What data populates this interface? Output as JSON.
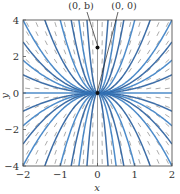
{
  "figure": {
    "title": "",
    "equation_hint": "dy/dx = 2y/x",
    "xlabel": "x",
    "ylabel": "y",
    "xlim": [
      -2,
      2
    ],
    "ylim": [
      -4,
      4
    ],
    "xticks": [
      {
        "v": -2,
        "label": "−2"
      },
      {
        "v": -1,
        "label": "−1"
      },
      {
        "v": 0,
        "label": "0"
      },
      {
        "v": 1,
        "label": "1"
      },
      {
        "v": 2,
        "label": "2"
      }
    ],
    "yticks": [
      {
        "v": -4,
        "label": "−4"
      },
      {
        "v": -2,
        "label": "−2"
      },
      {
        "v": 0,
        "label": "0"
      },
      {
        "v": 2,
        "label": "2"
      },
      {
        "v": 4,
        "label": "4"
      }
    ],
    "annotations": [
      {
        "label": "(0, b)",
        "point": [
          0,
          2.5
        ],
        "text_pos": [
          81,
          9
        ]
      },
      {
        "label": "(0, 0)",
        "point": [
          0,
          0
        ],
        "text_pos": [
          124,
          9
        ]
      }
    ],
    "colors": {
      "curve": "#3b7fc4",
      "curve_dark": "#2a5f9e",
      "slope": "#888888",
      "frame": "#555555",
      "point": "#111111"
    }
  },
  "chart_data": {
    "type": "slope_field",
    "title": "",
    "xlabel": "x",
    "ylabel": "y",
    "xlim": [
      -2,
      2
    ],
    "ylim": [
      -4,
      4
    ],
    "ode": "y' = 2y/x",
    "solution_family": "y = C x^2",
    "solution_curves_C": [
      -50,
      -16,
      -8,
      -4,
      -2,
      -1,
      -0.7,
      -0.45,
      -0.25,
      0,
      0.25,
      0.45,
      0.7,
      1,
      2,
      4,
      8,
      16,
      50
    ],
    "slope_grid": {
      "x_step": 0.25,
      "y_step": 0.5
    },
    "marked_points": [
      {
        "label": "(0, b)",
        "x": 0,
        "y": 2.5
      },
      {
        "label": "(0, 0)",
        "x": 0,
        "y": 0
      }
    ],
    "grid": false
  }
}
